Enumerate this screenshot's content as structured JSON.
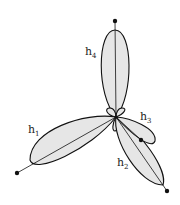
{
  "diagram": {
    "colors": {
      "lobe_fill": "#e6e6e6",
      "stroke": "#111111",
      "background": "#ffffff"
    },
    "center": [
      116,
      117
    ],
    "orbitals": [
      {
        "id": "h1",
        "label": "h",
        "subscript": "1",
        "label_pos": [
          28,
          133
        ],
        "end_dot": [
          17,
          173
        ]
      },
      {
        "id": "h2",
        "label": "h",
        "subscript": "2",
        "label_pos": [
          117,
          166
        ],
        "end_dot": [
          167,
          191
        ]
      },
      {
        "id": "h3",
        "label": "h",
        "subscript": "3",
        "label_pos": [
          140,
          120
        ],
        "end_dot": [
          141,
          140
        ]
      },
      {
        "id": "h4",
        "label": "h",
        "subscript": "4",
        "label_pos": [
          85,
          55
        ],
        "end_dot": [
          115,
          21
        ]
      }
    ]
  }
}
